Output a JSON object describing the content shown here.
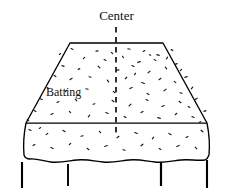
{
  "figure": {
    "type": "technical-line-drawing",
    "background_color": "#ffffff",
    "line_color": "#000000",
    "fill_color": "#ffffff"
  },
  "labels": {
    "center": "Center",
    "batting": "Batting"
  },
  "guides": {
    "center_line": {
      "name": "center-dashed-line",
      "style": "dashed",
      "x": 116,
      "y_top": 27,
      "y_bottom": 134
    },
    "seam_line": {
      "name": "horizontal-seam-line",
      "style": "solid",
      "y": 123,
      "x_left": 26,
      "x_right": 207
    }
  },
  "shape": {
    "top_edge": {
      "x_left": 70,
      "x_right": 163,
      "y": 43
    },
    "waist_corners": {
      "x_left": 26,
      "x_right": 207,
      "y": 123
    },
    "hem": {
      "y": 160,
      "style": "wavy"
    }
  },
  "legs": [
    {
      "name": "leg-1",
      "x": 22,
      "y_top": 162,
      "y_bottom": 188
    },
    {
      "name": "leg-2",
      "x": 68,
      "y_top": 164,
      "y_bottom": 186
    },
    {
      "name": "leg-3",
      "x": 161,
      "y_top": 162,
      "y_bottom": 186
    },
    {
      "name": "leg-4",
      "x": 207,
      "y_top": 160,
      "y_bottom": 188
    }
  ],
  "texture": {
    "description": "scattered short irregular flecks representing batting fibers",
    "flecks": [
      [
        72,
        49,
        2.2,
        22
      ],
      [
        97,
        51,
        2.0,
        -8
      ],
      [
        112,
        53,
        1.8,
        40
      ],
      [
        129,
        49,
        2.4,
        10
      ],
      [
        144,
        51,
        2.0,
        -30
      ],
      [
        158,
        55,
        2.6,
        15
      ],
      [
        84,
        58,
        1.9,
        -45
      ],
      [
        105,
        60,
        2.1,
        30
      ],
      [
        123,
        57,
        1.7,
        60
      ],
      [
        139,
        62,
        2.8,
        -15
      ],
      [
        155,
        60,
        2.2,
        35
      ],
      [
        167,
        58,
        2.0,
        -50
      ],
      [
        63,
        66,
        2.3,
        20
      ],
      [
        79,
        69,
        1.8,
        -25
      ],
      [
        99,
        67,
        2.5,
        45
      ],
      [
        118,
        70,
        2.0,
        -10
      ],
      [
        133,
        66,
        2.2,
        25
      ],
      [
        149,
        72,
        2.7,
        -40
      ],
      [
        166,
        68,
        2.1,
        50
      ],
      [
        176,
        64,
        2.4,
        -20
      ],
      [
        55,
        76,
        2.0,
        35
      ],
      [
        71,
        79,
        2.6,
        -30
      ],
      [
        90,
        77,
        1.9,
        15
      ],
      [
        108,
        81,
        2.3,
        55
      ],
      [
        126,
        78,
        2.1,
        -45
      ],
      [
        143,
        83,
        2.8,
        20
      ],
      [
        160,
        79,
        2.4,
        -35
      ],
      [
        175,
        82,
        2.0,
        40
      ],
      [
        186,
        77,
        2.5,
        -15
      ],
      [
        48,
        88,
        2.2,
        25
      ],
      [
        66,
        91,
        1.8,
        -50
      ],
      [
        87,
        89,
        2.4,
        10
      ],
      [
        114,
        92,
        2.0,
        45
      ],
      [
        131,
        88,
        2.6,
        -25
      ],
      [
        148,
        94,
        2.2,
        30
      ],
      [
        165,
        90,
        2.9,
        -40
      ],
      [
        181,
        93,
        2.1,
        15
      ],
      [
        192,
        88,
        2.3,
        -55
      ],
      [
        41,
        99,
        2.5,
        20
      ],
      [
        58,
        102,
        2.0,
        -30
      ],
      [
        76,
        100,
        2.2,
        50
      ],
      [
        94,
        104,
        1.9,
        -15
      ],
      [
        113,
        101,
        2.4,
        35
      ],
      [
        130,
        105,
        2.7,
        -45
      ],
      [
        147,
        100,
        2.1,
        25
      ],
      [
        163,
        106,
        2.5,
        -20
      ],
      [
        180,
        102,
        2.3,
        40
      ],
      [
        196,
        99,
        2.8,
        -35
      ],
      [
        35,
        111,
        2.1,
        30
      ],
      [
        52,
        114,
        2.4,
        -25
      ],
      [
        70,
        112,
        1.9,
        45
      ],
      [
        89,
        116,
        2.2,
        -50
      ],
      [
        107,
        113,
        2.6,
        20
      ],
      [
        125,
        117,
        2.0,
        35
      ],
      [
        142,
        112,
        2.3,
        -30
      ],
      [
        159,
        118,
        2.7,
        15
      ],
      [
        176,
        114,
        2.1,
        -45
      ],
      [
        193,
        117,
        2.4,
        25
      ],
      [
        205,
        111,
        2.2,
        -20
      ],
      [
        30,
        130,
        2.3,
        25
      ],
      [
        47,
        134,
        2.0,
        -40
      ],
      [
        64,
        131,
        2.6,
        30
      ],
      [
        82,
        136,
        2.2,
        -15
      ],
      [
        100,
        132,
        1.9,
        50
      ],
      [
        118,
        137,
        2.4,
        -35
      ],
      [
        136,
        133,
        2.8,
        20
      ],
      [
        153,
        138,
        2.1,
        -50
      ],
      [
        170,
        134,
        2.5,
        30
      ],
      [
        187,
        137,
        2.2,
        -25
      ],
      [
        202,
        131,
        2.4,
        40
      ],
      [
        34,
        145,
        2.1,
        -30
      ],
      [
        52,
        148,
        2.5,
        25
      ],
      [
        70,
        144,
        2.0,
        -45
      ],
      [
        88,
        149,
        2.3,
        35
      ],
      [
        106,
        146,
        2.7,
        -20
      ],
      [
        124,
        150,
        2.2,
        15
      ],
      [
        142,
        145,
        2.4,
        -40
      ],
      [
        160,
        149,
        2.0,
        30
      ],
      [
        178,
        146,
        2.6,
        -25
      ],
      [
        196,
        148,
        2.3,
        45
      ],
      [
        60,
        54,
        1.6,
        -35
      ],
      [
        172,
        50,
        1.7,
        25
      ],
      [
        181,
        70,
        1.8,
        -45
      ],
      [
        189,
        107,
        1.9,
        30
      ],
      [
        200,
        122,
        1.7,
        -20
      ],
      [
        28,
        120,
        1.8,
        40
      ],
      [
        40,
        128,
        1.6,
        -30
      ],
      [
        150,
        55,
        1.5,
        20
      ],
      [
        135,
        74,
        1.6,
        -55
      ]
    ]
  }
}
